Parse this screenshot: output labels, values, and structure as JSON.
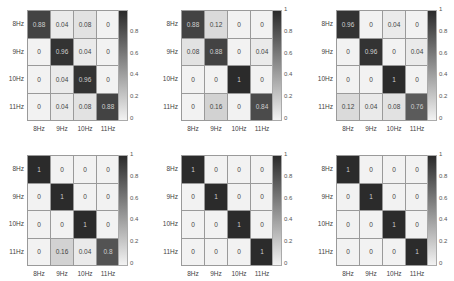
{
  "chart_data": [
    {
      "type": "heatmap",
      "title": "",
      "rows": [
        "8Hz",
        "9Hz",
        "10Hz",
        "11Hz"
      ],
      "cols": [
        "8Hz",
        "9Hz",
        "10Hz",
        "11Hz"
      ],
      "values": [
        [
          0.88,
          0.04,
          0.08,
          0
        ],
        [
          0,
          0.96,
          0.04,
          0
        ],
        [
          0,
          0.04,
          0.96,
          0
        ],
        [
          0,
          0.04,
          0.08,
          0.88
        ]
      ],
      "labels": [
        [
          "0.88",
          "0.04",
          "0.08",
          "0"
        ],
        [
          "0",
          "0.96",
          "0.04",
          "0"
        ],
        [
          "0",
          "0.04",
          "0.96",
          "0"
        ],
        [
          "0",
          "0.04",
          "0.08",
          "0.88"
        ]
      ],
      "colorbar_ticks": [
        "0",
        "0.2",
        "0.4",
        "0.6",
        "0.8",
        ""
      ],
      "clim": [
        0,
        1
      ]
    },
    {
      "type": "heatmap",
      "title": "",
      "rows": [
        "8Hz",
        "9Hz",
        "10Hz",
        "11Hz"
      ],
      "cols": [
        "8Hz",
        "9Hz",
        "10Hz",
        "11Hz"
      ],
      "values": [
        [
          0.88,
          0.12,
          0,
          0
        ],
        [
          0.08,
          0.88,
          0,
          0.04
        ],
        [
          0,
          0,
          1,
          0
        ],
        [
          0,
          0.16,
          0,
          0.84
        ]
      ],
      "labels": [
        [
          "0.88",
          "0.12",
          "0",
          "0"
        ],
        [
          "0.08",
          "0.88",
          "0",
          "0.04"
        ],
        [
          "0",
          "0",
          "1",
          "0"
        ],
        [
          "0",
          "0.16",
          "0",
          "0.84"
        ]
      ],
      "colorbar_ticks": [
        "0",
        "0.2",
        "0.4",
        "0.6",
        "0.8",
        "1"
      ],
      "clim": [
        0,
        1
      ]
    },
    {
      "type": "heatmap",
      "title": "",
      "rows": [
        "8Hz",
        "9Hz",
        "10Hz",
        "11Hz"
      ],
      "cols": [
        "8Hz",
        "9Hz",
        "10Hz",
        "11Hz"
      ],
      "values": [
        [
          0.96,
          0,
          0.04,
          0
        ],
        [
          0,
          0.96,
          0,
          0.04
        ],
        [
          0,
          0,
          1,
          0
        ],
        [
          0.12,
          0.04,
          0.08,
          0.76
        ]
      ],
      "labels": [
        [
          "0.96",
          "0",
          "0.04",
          "0"
        ],
        [
          "0",
          "0.96",
          "0",
          "0.04"
        ],
        [
          "0",
          "0",
          "1",
          "0"
        ],
        [
          "0.12",
          "0.04",
          "0.08",
          "0.76"
        ]
      ],
      "colorbar_ticks": [
        "0",
        "0.2",
        "0.4",
        "0.6",
        "0.8",
        "1"
      ],
      "clim": [
        0,
        1
      ]
    },
    {
      "type": "heatmap",
      "title": "",
      "rows": [
        "8Hz",
        "9Hz",
        "10Hz",
        "11Hz"
      ],
      "cols": [
        "8Hz",
        "9Hz",
        "10Hz",
        "11Hz"
      ],
      "values": [
        [
          1,
          0,
          0,
          0
        ],
        [
          0,
          1,
          0,
          0
        ],
        [
          0,
          0,
          1,
          0
        ],
        [
          0,
          0.16,
          0.04,
          0.8
        ]
      ],
      "labels": [
        [
          "1",
          "0",
          "0",
          "0"
        ],
        [
          "0",
          "1",
          "0",
          "0"
        ],
        [
          "0",
          "0",
          "1",
          "0"
        ],
        [
          "0",
          "0.16",
          "0.04",
          "0.8"
        ]
      ],
      "colorbar_ticks": [
        "0",
        "0.2",
        "0.4",
        "0.6",
        "0.8",
        "1"
      ],
      "clim": [
        0,
        1
      ]
    },
    {
      "type": "heatmap",
      "title": "",
      "rows": [
        "8Hz",
        "9Hz",
        "10Hz",
        "11Hz"
      ],
      "cols": [
        "8Hz",
        "9Hz",
        "10Hz",
        "11Hz"
      ],
      "values": [
        [
          1,
          0,
          0,
          0
        ],
        [
          0,
          1,
          0,
          0
        ],
        [
          0,
          0,
          1,
          0
        ],
        [
          0,
          0,
          0,
          1
        ]
      ],
      "labels": [
        [
          "1",
          "0",
          "0",
          "0"
        ],
        [
          "0",
          "1",
          "0",
          "0"
        ],
        [
          "0",
          "0",
          "1",
          "0"
        ],
        [
          "0",
          "0",
          "0",
          "1"
        ]
      ],
      "colorbar_ticks": [
        "0",
        "0.2",
        "0.4",
        "0.6",
        "0.8",
        "1"
      ],
      "clim": [
        0,
        1
      ]
    },
    {
      "type": "heatmap",
      "title": "",
      "rows": [
        "8Hz",
        "9Hz",
        "10Hz",
        "11Hz"
      ],
      "cols": [
        "8Hz",
        "9Hz",
        "10Hz",
        "11Hz"
      ],
      "values": [
        [
          1,
          0,
          0,
          0
        ],
        [
          0,
          1,
          0,
          0
        ],
        [
          0,
          0,
          1,
          0
        ],
        [
          0,
          0,
          0,
          1
        ]
      ],
      "labels": [
        [
          "1",
          "0",
          "0",
          "0"
        ],
        [
          "0",
          "1",
          "0",
          "0"
        ],
        [
          "0",
          "0",
          "1",
          "0"
        ],
        [
          "0",
          "0",
          "0",
          "1"
        ]
      ],
      "colorbar_ticks": [
        "0",
        "0.2",
        "0.4",
        "0.6",
        "0.8",
        "1"
      ],
      "clim": [
        0,
        1
      ]
    }
  ],
  "layout": {
    "panels": [
      {
        "x": 27,
        "y": 10,
        "cbx": 118
      },
      {
        "x": 181,
        "y": 10,
        "cbx": 272
      },
      {
        "x": 336,
        "y": 10,
        "cbx": 427
      },
      {
        "x": 27,
        "y": 155,
        "cbx": 118
      },
      {
        "x": 181,
        "y": 155,
        "cbx": 272
      },
      {
        "x": 336,
        "y": 155,
        "cbx": 427
      }
    ]
  }
}
